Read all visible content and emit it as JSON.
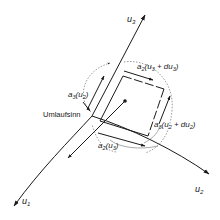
{
  "diagram": {
    "axes": {
      "u1": {
        "symbol": "u",
        "sub": "1"
      },
      "u2": {
        "symbol": "u",
        "sub": "2"
      },
      "u3": {
        "symbol": "u",
        "sub": "3"
      }
    },
    "labels": {
      "a3_u2": {
        "base": "a",
        "base_sub": "3",
        "arg": "(u",
        "arg_sub": "2",
        "close": ")"
      },
      "a2_u3_du3": {
        "base": "a",
        "base_sub": "2",
        "arg": "(u",
        "arg_sub": "3",
        "mid": " + du",
        "mid_sub": "3",
        "close": ")"
      },
      "a3_u2_du2": {
        "base": "a",
        "base_sub": "3",
        "arg": "(u",
        "arg_sub": "2",
        "mid": " + du",
        "mid_sub": "2",
        "close": ")"
      },
      "a2_u3": {
        "base": "a",
        "base_sub": "2",
        "arg": "(u",
        "arg_sub": "3",
        "close": ")"
      },
      "circulation": "Umlaufsinn"
    },
    "colors": {
      "ink": "#1a1a1a",
      "background": "#ffffff",
      "leader": "#555555"
    }
  }
}
